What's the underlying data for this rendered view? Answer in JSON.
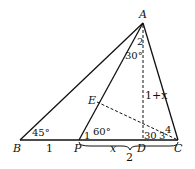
{
  "diagram": {
    "points": {
      "A": "A",
      "B": "B",
      "P": "P",
      "D": "D",
      "C": "C",
      "E": "E"
    },
    "angles": {
      "B": "45°",
      "P": "60°",
      "ang1": "1",
      "ang2": "2",
      "ang2_val": "30°",
      "ang3": "3",
      "ang4": "4",
      "D_angle": "30"
    },
    "lengths": {
      "BP": "1",
      "PD": "x",
      "PC": "2",
      "AD": "1+x"
    },
    "colors": {
      "stroke": "#111111",
      "background": "#ffffff"
    }
  }
}
